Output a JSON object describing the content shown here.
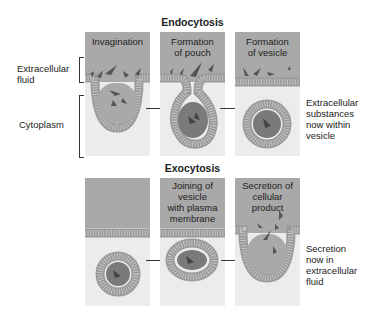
{
  "colors": {
    "fluid": "#a9a9a9",
    "cytoplasm": "#ececec",
    "membrane": "#8f8f8f",
    "particle": "#555555",
    "vesicle_core": "#7a7a7a"
  },
  "endocytosis": {
    "title": "Endocytosis",
    "side_labels": {
      "extracellular_fluid": "Extracellular\nfluid",
      "extracellular_fluid_line1": "Extracellular",
      "extracellular_fluid_line2": "fluid",
      "cytoplasm": "Cytoplasm"
    },
    "panels": [
      {
        "title_line1": "Invagination",
        "title_line2": ""
      },
      {
        "title_line1": "Formation",
        "title_line2": "of pouch"
      },
      {
        "title_line1": "Formation",
        "title_line2": "of vesicle"
      }
    ],
    "result": {
      "line1": "Extracellular",
      "line2": "substances",
      "line3": "now within",
      "line4": "vesicle"
    }
  },
  "exocytosis": {
    "title": "Exocytosis",
    "panels": [
      {
        "title_line1": "",
        "title_line2": "",
        "title_line3": "",
        "title_line4": ""
      },
      {
        "title_line1": "Joining of",
        "title_line2": "vesicle",
        "title_line3": "with plasma",
        "title_line4": "membrane"
      },
      {
        "title_line1": "Secretion of",
        "title_line2": "cellular",
        "title_line3": "product",
        "title_line4": ""
      }
    ],
    "result": {
      "line1": "Secretion",
      "line2": "now in",
      "line3": "extracellular",
      "line4": "fluid"
    }
  }
}
